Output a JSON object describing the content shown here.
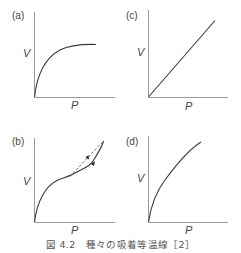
{
  "figure": {
    "caption": "図 4.2　種々の吸着等温線［2］",
    "panels": [
      {
        "id": "a",
        "label": "(a)",
        "x_axis": "P",
        "y_axis": "V",
        "shape": "saturating-concave (Langmuir type)"
      },
      {
        "id": "c",
        "label": "(c)",
        "x_axis": "P",
        "y_axis": "V",
        "shape": "linear (Henry type)"
      },
      {
        "id": "b",
        "label": "(b)",
        "x_axis": "P",
        "y_axis": "V",
        "shape": "S-shaped with hysteresis loop (dashed desorption branch with arrows)"
      },
      {
        "id": "d",
        "label": "(d)",
        "x_axis": "P",
        "y_axis": "V",
        "shape": "concave, non-saturating (Freundlich type)"
      }
    ]
  },
  "colors": {
    "axis": "#9a9a9a",
    "curve": "#3a3a3a",
    "text": "#444444"
  }
}
